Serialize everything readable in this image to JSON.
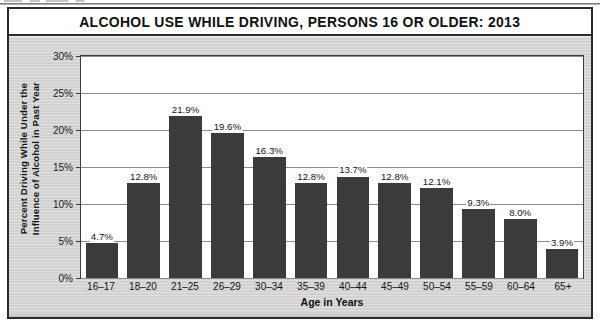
{
  "figure": {
    "title": "ALCOHOL USE WHILE DRIVING, PERSONS 16 OR OLDER: 2013",
    "panel_color": "#d6d6d6",
    "plot_background": "#ffffff",
    "frame_color": "#2b2b2b"
  },
  "axes": {
    "y_title_line1": "Percent Driving While Under the",
    "y_title_line2": "Influence of Alcohol in Past Year",
    "x_title": "Age in Years",
    "y_ticks": [
      "0%",
      "5%",
      "10%",
      "15%",
      "20%",
      "25%",
      "30%"
    ]
  },
  "chart_data": {
    "type": "bar",
    "title": "ALCOHOL USE WHILE DRIVING, PERSONS 16 OR OLDER: 2013",
    "xlabel": "Age in Years",
    "ylabel": "Percent Driving While Under the Influence of Alcohol in Past Year",
    "ylim": [
      0,
      30
    ],
    "ytick_values": [
      0,
      5,
      10,
      15,
      20,
      25,
      30
    ],
    "ytick_labels": [
      "0%",
      "5%",
      "10%",
      "15%",
      "20%",
      "25%",
      "30%"
    ],
    "grid": true,
    "legend": false,
    "bar_color": "#3b3b3b",
    "categories": [
      "16–17",
      "18–20",
      "21–25",
      "26–29",
      "30–34",
      "35–39",
      "40–44",
      "45–49",
      "50–54",
      "55–59",
      "60–64",
      "65+"
    ],
    "values": [
      4.7,
      12.8,
      21.9,
      19.6,
      16.3,
      12.8,
      13.7,
      12.8,
      12.1,
      9.3,
      8.0,
      3.9
    ],
    "data_labels": [
      "4.7%",
      "12.8%",
      "21.9%",
      "19.6%",
      "16.3%",
      "12.8%",
      "13.7%",
      "12.8%",
      "12.1%",
      "9.3%",
      "8.0%",
      "3.9%"
    ]
  }
}
